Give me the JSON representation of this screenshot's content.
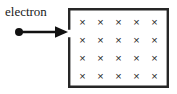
{
  "diagram": {
    "label": {
      "electron": "electron"
    },
    "arrow": {
      "direction": "right",
      "meaning": "velocity"
    },
    "field_region": {
      "symbol": "×",
      "meaning": "magnetic field into page",
      "rows": 4,
      "columns": 5,
      "grid": [
        [
          "×",
          "×",
          "×",
          "×",
          "×"
        ],
        [
          "×",
          "×",
          "×",
          "×",
          "×"
        ],
        [
          "×",
          "×",
          "×",
          "×",
          "×"
        ],
        [
          "×",
          "×",
          "×",
          "×",
          "×"
        ]
      ]
    },
    "colors": {
      "ink": "#1a1a1a",
      "cross": "#2a2a2a",
      "background": "#ffffff"
    }
  }
}
